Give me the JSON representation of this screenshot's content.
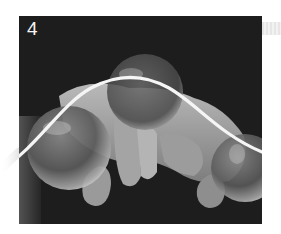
{
  "figure": {
    "step_number": "4",
    "colors": {
      "background": "#ffffff",
      "photo_background": "#1c1c1c",
      "wave": "#f5f5f5",
      "label": "#f4f4f4",
      "side_tab": "#eaeaea"
    },
    "icons": {
      "motion_path": "sine-wave-curve"
    }
  }
}
